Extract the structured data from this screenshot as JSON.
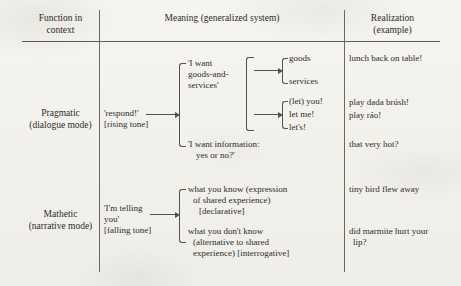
{
  "table": {
    "headers": [
      {
        "line1": "Function in",
        "line2": "context"
      },
      {
        "line1": "Meaning (generalized system)",
        "line2": ""
      },
      {
        "line1": "Realization",
        "line2": "(example)"
      }
    ]
  },
  "rows": [
    {
      "function": {
        "line1": "Pragmatic",
        "line2": "(dialogue mode)"
      },
      "gloss": {
        "line1": "'respond!'",
        "line2": "[rising tone]"
      },
      "options": [
        {
          "label_lines": [
            "'I want",
            "goods-and-",
            "services'"
          ],
          "subsystems": [
            {
              "items": [
                "goods",
                "services"
              ],
              "examples": [
                "lunch back on table!"
              ]
            },
            {
              "items": [
                "(let) you!",
                "let me!",
                "let's!"
              ],
              "examples": [
                "play dada brúsh!",
                "play ráo!"
              ]
            }
          ]
        },
        {
          "label_lines": [
            "'I want information:",
            "yes or no?'"
          ],
          "subsystems": [],
          "examples": [
            "that very hot?"
          ]
        }
      ]
    },
    {
      "function": {
        "line1": "Mathetic",
        "line2": "(narrative mode)"
      },
      "gloss": {
        "line1": "'I'm telling",
        "line2": "you'",
        "line3": "[falling tone]"
      },
      "options": [
        {
          "label_lines": [
            "what you know (expression",
            "of shared experience)",
            "[declarative]"
          ],
          "examples": [
            "tiny bird flew away"
          ]
        },
        {
          "label_lines": [
            "what you don't know",
            "(alternative to shared",
            "experience) [interrogative]"
          ],
          "examples": [
            "did marmite hurt your",
            "lip?"
          ]
        }
      ]
    }
  ],
  "colors": {
    "ink": "#2e2c2a",
    "rule": "#5d5b57",
    "paper": "#f4f3ef"
  }
}
